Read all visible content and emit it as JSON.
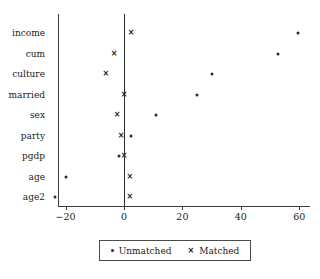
{
  "chart_data": {
    "type": "scatter",
    "title": "",
    "xlabel": "",
    "ylabel": "",
    "orientation": "horizontal",
    "categories": [
      "income",
      "cum",
      "culture",
      "married",
      "sex",
      "party",
      "pgdp",
      "age",
      "age2"
    ],
    "xticks": [
      -20,
      0,
      20,
      40,
      60
    ],
    "xtick_labels": [
      "−20",
      "0",
      "20",
      "40",
      "60"
    ],
    "xlim": [
      -28,
      66
    ],
    "grid": false,
    "zero_line": true,
    "legend_position": "bottom",
    "series": [
      {
        "name": "Unmatched",
        "marker": "dot",
        "values": [
          59.5,
          52.7,
          30.0,
          25.0,
          11.0,
          2.4,
          -1.7,
          -20.0,
          -23.5
        ]
      },
      {
        "name": "Matched",
        "marker": "x",
        "values": [
          2.4,
          -3.4,
          -6.2,
          0.0,
          -2.4,
          -1.0,
          0.0,
          2.0,
          2.0
        ]
      }
    ]
  },
  "legend": {
    "items": [
      {
        "label": "Unmatched",
        "marker": "dot-marker"
      },
      {
        "label": "Matched",
        "marker": "x-marker"
      }
    ]
  },
  "markers": {
    "x_glyph": "×"
  }
}
